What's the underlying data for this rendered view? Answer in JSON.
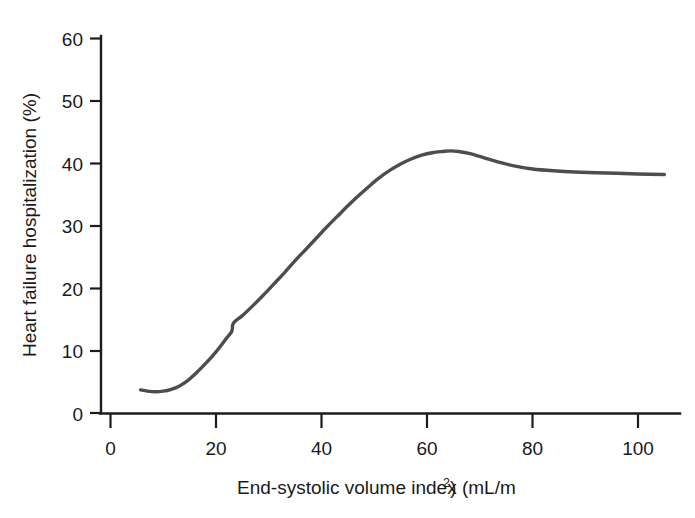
{
  "chart_data": {
    "type": "line",
    "title": "",
    "xlabel": "End-systolic volume index (mL/m²)",
    "xlabel_main": "End-systolic volume index (mL/m",
    "xlabel_sup": "2",
    "xlabel_tail": ")",
    "ylabel": "Heart failure hospitalization (%)",
    "xlim": [
      0,
      108
    ],
    "ylim": [
      0,
      62
    ],
    "xticks": [
      0,
      20,
      40,
      60,
      80,
      100
    ],
    "xtick_labels": [
      "0",
      "20",
      "40",
      "60",
      "80",
      "100"
    ],
    "yticks": [
      0,
      10,
      20,
      30,
      40,
      50,
      60
    ],
    "ytick_labels": [
      "0",
      "10",
      "20",
      "30",
      "40",
      "50",
      "60"
    ],
    "grid": false,
    "legend": "none",
    "line_color": "#4d4d4d",
    "axis_color": "#1c1c1c",
    "series": [
      {
        "name": "Heart failure hospitalization",
        "x": [
          5.7,
          7.0,
          8.5,
          10.0,
          11.5,
          13.0,
          14.5,
          16.0,
          18.0,
          20.0,
          22.0,
          23.0,
          23.3,
          25.0,
          27.0,
          29.0,
          31.0,
          33.0,
          35.0,
          37.0,
          39.0,
          41.0,
          43.0,
          45.0,
          47.0,
          49.0,
          51.0,
          53.0,
          55.0,
          57.0,
          59.0,
          61.0,
          63.0,
          64.5,
          66.0,
          68.0,
          70.0,
          72.0,
          74.0,
          77.0,
          80.0,
          84.0,
          88.0,
          92.0,
          96.0,
          100.0,
          105.0
        ],
        "y": [
          3.7,
          3.5,
          3.4,
          3.5,
          3.8,
          4.3,
          5.1,
          6.2,
          7.9,
          9.8,
          12.0,
          13.1,
          14.4,
          15.6,
          17.2,
          18.9,
          20.7,
          22.5,
          24.4,
          26.2,
          28.0,
          29.8,
          31.5,
          33.2,
          34.8,
          36.3,
          37.7,
          38.9,
          39.9,
          40.7,
          41.3,
          41.7,
          41.9,
          42.0,
          41.9,
          41.6,
          41.1,
          40.6,
          40.1,
          39.5,
          39.1,
          38.8,
          38.6,
          38.5,
          38.4,
          38.3,
          38.2
        ]
      }
    ],
    "annotations": [
      "curve begins near x=6 at 3.7%",
      "slight dip near x=8.5 to 3.4%",
      "small step/notch near x=23 at about 14%",
      "peak about 42% near x=64",
      "plateau about 38% beyond x=85"
    ]
  }
}
